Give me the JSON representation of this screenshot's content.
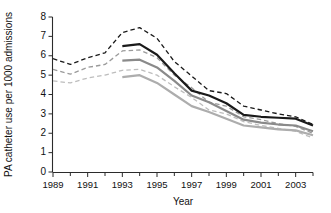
{
  "chart_data": {
    "type": "line",
    "title": "",
    "xlabel": "Year",
    "ylabel": "PA catheter use per 1000 admissions",
    "xlim": [
      1989,
      2004
    ],
    "ylim": [
      0,
      8
    ],
    "grid": false,
    "legend": "none",
    "x_tick_labels": [
      "1989",
      "1991",
      "1993",
      "1995",
      "1997",
      "1999",
      "2001",
      "2003"
    ],
    "x_tick_values": [
      1989,
      1991,
      1993,
      1995,
      1997,
      1999,
      2001,
      2003
    ],
    "x_minor_tick_values": [
      1990,
      1992,
      1994,
      1996,
      1998,
      2000,
      2002,
      2004
    ],
    "y_tick_labels": [
      "0",
      "1",
      "2",
      "3",
      "4",
      "5",
      "6",
      "7",
      "8"
    ],
    "y_tick_values": [
      0,
      1,
      2,
      3,
      4,
      5,
      6,
      7,
      8
    ],
    "colors": {
      "black": "#1a1a1a",
      "dark_gray": "#808080",
      "light_gray": "#b8b8b8"
    },
    "series": [
      {
        "name": "observed-black-dashed-upper",
        "style": "dashed",
        "color": "#1a1a1a",
        "width": 1.3,
        "x": [
          1989,
          1990,
          1991,
          1992,
          1993,
          1994,
          1995,
          1996,
          1997,
          1998,
          1999,
          2000,
          2001,
          2002,
          2003,
          2004
        ],
        "values": [
          5.85,
          5.55,
          5.9,
          6.15,
          7.2,
          7.45,
          6.9,
          5.7,
          4.95,
          4.2,
          4.05,
          3.4,
          3.2,
          3.0,
          2.85,
          2.45
        ]
      },
      {
        "name": "observed-gray-dashed-mid",
        "style": "dashed",
        "color": "#9a9a9a",
        "width": 1.3,
        "x": [
          1989,
          1990,
          1991,
          1992,
          1993,
          1994,
          1995,
          1996,
          1997,
          1998,
          1999,
          2000,
          2001,
          2002,
          2003,
          2004
        ],
        "values": [
          5.3,
          5.05,
          5.4,
          5.55,
          6.25,
          6.3,
          5.9,
          5.0,
          4.35,
          3.6,
          3.4,
          2.85,
          2.7,
          2.5,
          2.35,
          2.0
        ]
      },
      {
        "name": "observed-lightgray-dashed-lower",
        "style": "dashed",
        "color": "#bdbdbd",
        "width": 1.3,
        "x": [
          1989,
          1990,
          1991,
          1992,
          1993,
          1994,
          1995,
          1996,
          1997,
          1998,
          1999,
          2000,
          2001,
          2002,
          2003,
          2004
        ],
        "values": [
          4.7,
          4.6,
          4.85,
          5.0,
          5.25,
          5.3,
          5.0,
          4.4,
          3.85,
          3.2,
          3.0,
          2.6,
          2.4,
          2.25,
          2.1,
          1.75
        ]
      },
      {
        "name": "fitted-black-solid",
        "style": "solid",
        "color": "#1a1a1a",
        "width": 2.2,
        "x": [
          1993,
          1994,
          1995,
          1996,
          1997,
          1998,
          1999,
          2000,
          2001,
          2002,
          2003,
          2004
        ],
        "values": [
          6.5,
          6.6,
          6.05,
          5.1,
          4.2,
          3.95,
          3.55,
          2.95,
          2.85,
          2.8,
          2.75,
          2.4
        ]
      },
      {
        "name": "fitted-gray-solid",
        "style": "solid",
        "color": "#8a8a8a",
        "width": 2.2,
        "x": [
          1993,
          1994,
          1995,
          1996,
          1997,
          1998,
          1999,
          2000,
          2001,
          2002,
          2003,
          2004
        ],
        "values": [
          5.75,
          5.8,
          5.4,
          4.7,
          3.95,
          3.6,
          3.15,
          2.7,
          2.55,
          2.45,
          2.4,
          2.1
        ]
      },
      {
        "name": "fitted-lightgray-solid",
        "style": "solid",
        "color": "#adadad",
        "width": 2.2,
        "x": [
          1993,
          1994,
          1995,
          1996,
          1997,
          1998,
          1999,
          2000,
          2001,
          2002,
          2003,
          2004
        ],
        "values": [
          4.9,
          5.0,
          4.6,
          4.0,
          3.4,
          3.1,
          2.75,
          2.4,
          2.3,
          2.2,
          2.15,
          1.9
        ]
      }
    ]
  }
}
